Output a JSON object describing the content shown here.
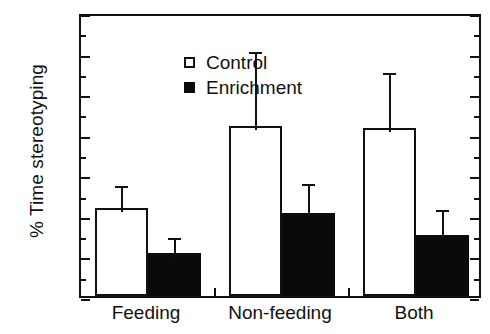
{
  "chart_data": {
    "type": "bar",
    "title": "",
    "xlabel": "",
    "ylabel": "% Time stereotyping",
    "categories": [
      "Feeding",
      "Non-feeding",
      "Both"
    ],
    "ylim": [
      0,
      35
    ],
    "ytick_labels": [
      "0",
      "5",
      "10",
      "15",
      "20",
      "25",
      "30",
      "35"
    ],
    "ytick_values": [
      0,
      5,
      10,
      15,
      20,
      25,
      30,
      35
    ],
    "ytick_minor_values": [
      2.5,
      7.5,
      12.5,
      17.5,
      22.5,
      27.5,
      32.5
    ],
    "grid": false,
    "legend_position": "upper-left-inside",
    "series": [
      {
        "name": "Control",
        "marker": "open-square",
        "color": "#ffffff",
        "edge_color": "#111111",
        "values": [
          10.9,
          21.0,
          20.7
        ],
        "error_upper": [
          3.1,
          9.6,
          7.3
        ],
        "error_top_values": [
          14.0,
          30.6,
          28.0
        ]
      },
      {
        "name": "Enrichment",
        "marker": "filled-square",
        "color": "#0a0a0a",
        "edge_color": "#0a0a0a",
        "values": [
          5.3,
          10.2,
          7.5
        ],
        "error_upper": [
          2.3,
          4.1,
          3.6
        ],
        "error_top_values": [
          7.6,
          14.3,
          11.1
        ]
      }
    ]
  },
  "legend": {
    "items": [
      {
        "label": "Control",
        "marker": "open-square"
      },
      {
        "label": "Enrichment",
        "marker": "filled-square"
      }
    ]
  },
  "axis": {
    "y_title": "% Time stereotyping"
  }
}
